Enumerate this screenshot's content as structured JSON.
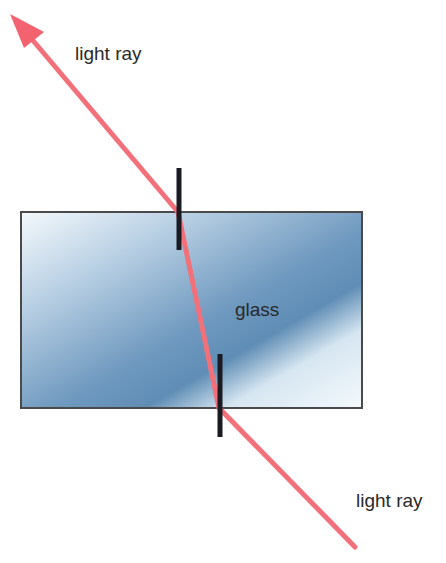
{
  "diagram": {
    "labels": {
      "incoming_ray": "light ray",
      "medium": "glass",
      "outgoing_ray": "light ray"
    },
    "colors": {
      "ray": "#f2707a",
      "normal": "#1a1a22",
      "glass_dark": "#5f8db5",
      "glass_light": "#f4f9fc",
      "glass_border": "#4a4a4a",
      "text": "#2a2a2a"
    },
    "glass_block": {
      "x": 21,
      "y": 212,
      "width": 341,
      "height": 196
    },
    "ray_path": [
      [
        10,
        14
      ],
      [
        178,
        212
      ],
      [
        219,
        408
      ],
      [
        355,
        547
      ]
    ],
    "normals": [
      {
        "x": 179,
        "y1": 168,
        "y2": 250
      },
      {
        "x": 220,
        "y1": 354,
        "y2": 437
      }
    ]
  }
}
